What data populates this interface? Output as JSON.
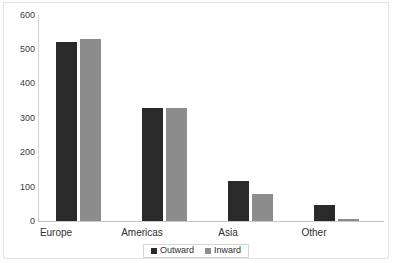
{
  "chart_data": {
    "type": "bar",
    "title": "",
    "xlabel": "",
    "ylabel": "",
    "ylim": [
      0,
      600
    ],
    "yticks": [
      0,
      100,
      200,
      300,
      400,
      500,
      600
    ],
    "grid": false,
    "legend_position": "bottom-center",
    "categories": [
      "Europe",
      "Americas",
      "Asia",
      "Other"
    ],
    "series": [
      {
        "name": "Outward",
        "color": "#2a2a2a",
        "values": [
          520,
          530,
          328,
          328
        ]
      },
      {
        "name": "Inward",
        "color": "#8c8c8c",
        "values": [
          118,
          78,
          47,
          7
        ]
      }
    ],
    "groups": [
      {
        "category": "Europe",
        "outward": 520,
        "inward": 530
      },
      {
        "category": "Americas",
        "outward": 328,
        "inward": 328
      },
      {
        "category": "Asia",
        "outward": 118,
        "inward": 78
      },
      {
        "category": "Other",
        "outward": 47,
        "inward": 7
      }
    ]
  },
  "axis": {
    "tick_labels": [
      "600",
      "500",
      "400",
      "300",
      "200",
      "100",
      "0"
    ]
  },
  "legend": {
    "items": [
      {
        "label": "Outward",
        "color": "#2a2a2a"
      },
      {
        "label": "Inward",
        "color": "#8c8c8c"
      }
    ]
  },
  "colors": {
    "outward": "#2a2a2a",
    "inward": "#8c8c8c",
    "axis": "#c8c8c8",
    "frame": "#e3e3e3",
    "text": "#2e2e2e"
  }
}
